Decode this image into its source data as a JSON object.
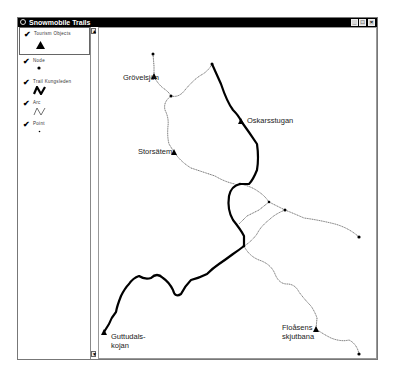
{
  "window": {
    "title": "Snowmobile Trails",
    "controls": {
      "minimize": "_",
      "maximize": "□",
      "close": "×"
    }
  },
  "legend": {
    "items": [
      {
        "label": "Tourism Objects",
        "checked": true,
        "check_glyph": "✔",
        "symbol": "triangle-icon"
      },
      {
        "label": "Node",
        "checked": true,
        "check_glyph": "✔",
        "symbol": "dot-icon"
      },
      {
        "label": "Trail Kungsleden",
        "checked": true,
        "check_glyph": "✔",
        "symbol": "bold-line-icon"
      },
      {
        "label": "Arc",
        "checked": true,
        "check_glyph": "✔",
        "symbol": "thin-line-icon"
      },
      {
        "label": "Point",
        "checked": true,
        "check_glyph": "✔",
        "symbol": "small-dot-icon"
      }
    ],
    "scroll_up": "▲",
    "scroll_down": "▼"
  },
  "map": {
    "places": [
      {
        "name": "Grövelsjön",
        "line1": "Grövelsjön",
        "line2": ""
      },
      {
        "name": "Oskarsstugan",
        "line1": "Oskarsstugan",
        "line2": ""
      },
      {
        "name": "Storsätem",
        "line1": "Storsätem",
        "line2": ""
      },
      {
        "name": "Guttudalskojan",
        "line1": "Guttudals-",
        "line2": "kojan"
      },
      {
        "name": "Floåsens skjutbana",
        "line1": "Floåsens",
        "line2": "skjutbana"
      }
    ],
    "colors": {
      "trail": "#000000",
      "arc": "#333333",
      "background": "#ffffff"
    }
  }
}
